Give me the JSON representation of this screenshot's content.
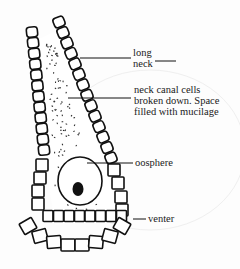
{
  "diagram": {
    "labels": {
      "long_neck_line1": "long",
      "long_neck_line2": "neck",
      "canal_line1": "neck canal cells",
      "canal_line2": "broken down. Space",
      "canal_line3": "filled with mucilage",
      "oosphere": "oosphere",
      "venter": "venter"
    },
    "colors": {
      "ink": "#111111",
      "paper": "#fdfdfd"
    }
  }
}
